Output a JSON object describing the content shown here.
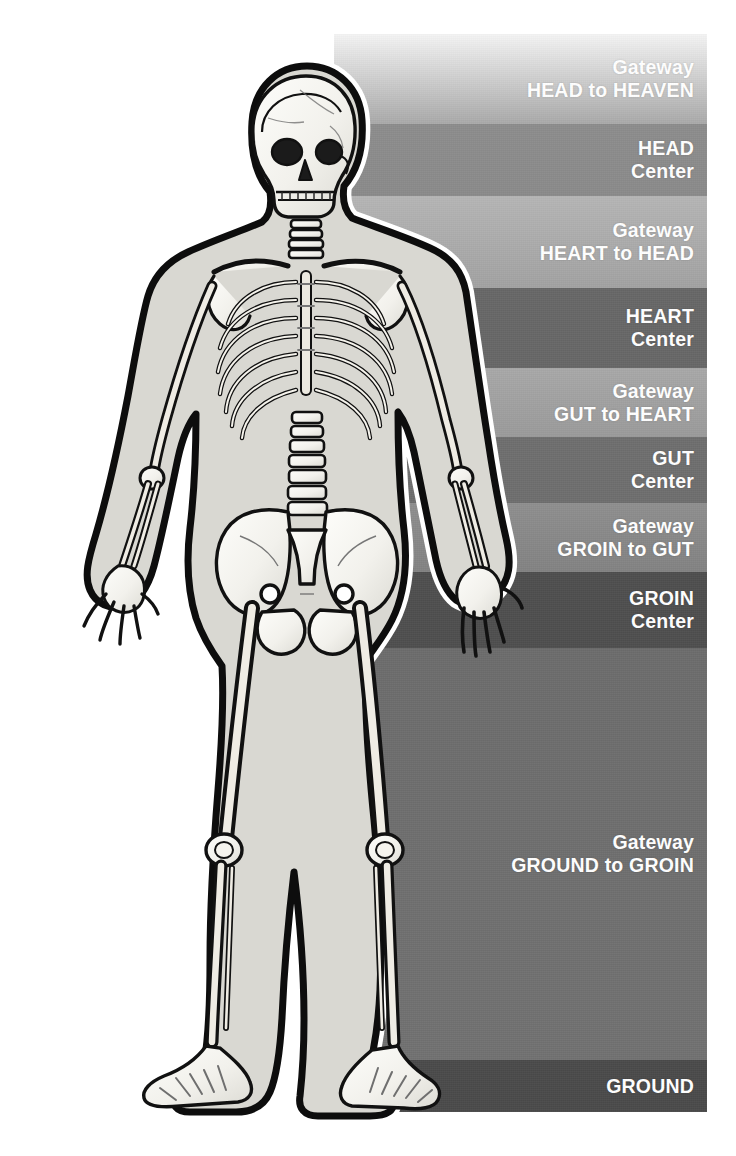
{
  "figure": {
    "subject_icon": "human-skeleton-illustration",
    "background_color": "#ffffff",
    "label_text_color": "#ffffff"
  },
  "panel": {
    "x": 334,
    "y": 34,
    "width": 373,
    "height": 1078
  },
  "bands": [
    {
      "id": "gateway-head-to-heaven",
      "kind": "gateway",
      "line1": "Gateway",
      "line2": "HEAD to HEAVEN",
      "top": 0,
      "height": 90,
      "color_top": "#f4f4f4",
      "color_bottom": "#a9a9a9"
    },
    {
      "id": "head-center",
      "kind": "center",
      "line1": "HEAD",
      "line2": "Center",
      "top": 90,
      "height": 72,
      "color_top": "#8c8c8c",
      "color_bottom": "#8a8a8a"
    },
    {
      "id": "gateway-heart-to-head",
      "kind": "gateway",
      "line1": "Gateway",
      "line2": "HEART to HEAD",
      "top": 162,
      "height": 92,
      "color_top": "#b5b5b5",
      "color_bottom": "#a2a2a2"
    },
    {
      "id": "heart-center",
      "kind": "center",
      "line1": "HEART",
      "line2": "Center",
      "top": 254,
      "height": 80,
      "color_top": "#676767",
      "color_bottom": "#676767"
    },
    {
      "id": "gateway-gut-to-heart",
      "kind": "gateway",
      "line1": "Gateway",
      "line2": "GUT to HEART",
      "top": 334,
      "height": 69,
      "color_top": "#a8a8a8",
      "color_bottom": "#9a9a9a"
    },
    {
      "id": "gut-center",
      "kind": "center",
      "line1": "GUT",
      "line2": "Center",
      "top": 403,
      "height": 66,
      "color_top": "#6e6e6e",
      "color_bottom": "#6e6e6e"
    },
    {
      "id": "gateway-groin-to-gut",
      "kind": "gateway",
      "line1": "Gateway",
      "line2": "GROIN to GUT",
      "top": 469,
      "height": 69,
      "color_top": "#8e8e8e",
      "color_bottom": "#828282"
    },
    {
      "id": "groin-center",
      "kind": "center",
      "line1": "GROIN",
      "line2": "Center",
      "top": 538,
      "height": 76,
      "color_top": "#4e4e4e",
      "color_bottom": "#4e4e4e"
    },
    {
      "id": "gateway-ground-to-groin",
      "kind": "gateway",
      "line1": "Gateway",
      "line2": "GROUND to GROIN",
      "top": 614,
      "height": 412,
      "color_top": "#6c6c6c",
      "color_bottom": "#717171"
    },
    {
      "id": "ground",
      "kind": "ground",
      "line1": "GROUND",
      "line2": "",
      "top": 1026,
      "height": 52,
      "color_top": "#4a4a4a",
      "color_bottom": "#4a4a4a"
    }
  ]
}
